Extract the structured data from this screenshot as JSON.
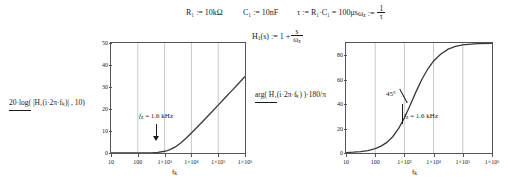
{
  "definitions": [
    {
      "name": "R1",
      "text": "R₁ := 10kΩ"
    },
    {
      "name": "C1",
      "text": "C₁ := 10nF"
    },
    {
      "name": "tau",
      "text": "τ := R₁·C₁ = 100μs"
    },
    {
      "name": "omega_z",
      "lhs": "ω",
      "lhs_sub": "z",
      "op": ":=",
      "num": "1",
      "den": "τ"
    }
  ],
  "transfer_function": {
    "lhs": "H",
    "lhs_sub": "1",
    "arg": "(s)",
    "op": ":=",
    "term1": "1 +",
    "num": "s",
    "den": "ω",
    "den_sub": "z"
  },
  "charts": [
    {
      "id": "magnitude",
      "type": "line",
      "title": "",
      "ylabel": "20·log( |H₁(i·2π·fₖ)| , 10)",
      "xlabel": "fₖ",
      "xlabel_plain": "f",
      "xlabel_sub": "k",
      "xticks": [
        "10",
        "100",
        "1×10³",
        "1×10⁴",
        "1×10⁵",
        "1×10⁶"
      ],
      "xtick_values": [
        1,
        2,
        3,
        4,
        5,
        6
      ],
      "yticks": [
        "0",
        "10",
        "20",
        "30",
        "40",
        "50"
      ],
      "ytick_values": [
        0,
        10,
        20,
        30,
        40,
        50
      ],
      "xlim": [
        1,
        6
      ],
      "ylim": [
        0,
        50
      ],
      "grid": true,
      "legend": "none",
      "annotation": {
        "label_plain": "f",
        "label_sub": "z",
        "label_rest": " = 1.6 kHz",
        "label": "f_z = 1.6 kHz",
        "marker": "down-arrow"
      },
      "series": [
        {
          "name": "magnitude_dB",
          "x": [
            1.0,
            1.25,
            1.5,
            1.75,
            2.0,
            2.25,
            2.5,
            2.75,
            3.0,
            3.1,
            3.2,
            3.4,
            3.6,
            3.8,
            4.0,
            4.25,
            4.5,
            4.75,
            5.0,
            5.25,
            5.5,
            5.75,
            6.0
          ],
          "y": [
            0.0,
            0.0,
            0.0,
            0.0,
            0.01,
            0.03,
            0.09,
            0.27,
            0.79,
            1.12,
            1.55,
            2.77,
            4.52,
            6.69,
            9.06,
            12.15,
            15.32,
            18.53,
            21.76,
            25.0,
            28.25,
            31.5,
            34.75
          ]
        }
      ]
    },
    {
      "id": "phase",
      "type": "line",
      "title": "",
      "ylabel": "arg( H₁(i·2π·fₖ) )·180/π",
      "xlabel": "fₖ",
      "xlabel_plain": "f",
      "xlabel_sub": "k",
      "xticks": [
        "10",
        "100",
        "1×10³",
        "1×10⁴",
        "1×10⁵",
        "1×10⁶"
      ],
      "xtick_values": [
        1,
        2,
        3,
        4,
        5,
        6
      ],
      "yticks": [
        "0",
        "20",
        "40",
        "60",
        "80"
      ],
      "ytick_values": [
        0,
        20,
        40,
        60,
        80
      ],
      "xlim": [
        1,
        6
      ],
      "ylim": [
        0,
        90
      ],
      "grid": true,
      "legend": "none",
      "annotations": [
        {
          "name": "forty-five-deg",
          "label": "45°",
          "marker": "diagonal-tick"
        },
        {
          "name": "fz-label",
          "label_plain": "f",
          "label_sub": "z",
          "label_rest": " = 1.6 kHz",
          "label": "f_z = 1.6 kHz",
          "marker": "vertical-tick"
        }
      ],
      "series": [
        {
          "name": "phase_deg",
          "x": [
            1.0,
            1.25,
            1.5,
            1.75,
            2.0,
            2.2,
            2.4,
            2.6,
            2.8,
            3.0,
            3.1,
            3.2,
            3.4,
            3.6,
            3.8,
            4.0,
            4.25,
            4.5,
            4.75,
            5.0,
            5.5,
            6.0
          ],
          "y": [
            0.36,
            0.64,
            1.14,
            2.02,
            3.58,
            5.6,
            8.7,
            13.3,
            19.9,
            28.8,
            33.9,
            39.3,
            50.2,
            60.3,
            68.7,
            75.3,
            81.0,
            85.0,
            87.2,
            88.4,
            89.5,
            89.8
          ]
        }
      ]
    }
  ],
  "colors": {
    "curve": "#3a3a3a",
    "grid": "#c8c8c8",
    "axis": "#555555",
    "text": "#1a1a1a",
    "background": "#ffffff"
  }
}
